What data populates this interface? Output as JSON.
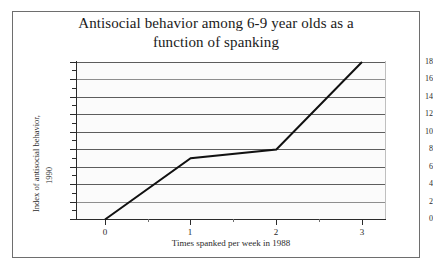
{
  "chart_data": {
    "type": "line",
    "title": "Antisocial behavior among 6-9 year olds as a function of spanking",
    "title_line1": "Antisocial behavior among 6-9 year olds as a",
    "title_line2": "function of spanking",
    "xlabel": "Times spanked per week in 1988",
    "ylabel": "Index of antisocial behavior, 1990",
    "ylabel_line1": "Index of antisocial behavior,",
    "ylabel_line2": "1990",
    "x": [
      0,
      1,
      2,
      3
    ],
    "values": [
      0,
      7,
      8,
      18
    ],
    "series": [
      {
        "name": "Index of antisocial behavior",
        "x": [
          0,
          1,
          2,
          3
        ],
        "values": [
          0,
          7,
          8,
          18
        ]
      }
    ],
    "xlim": [
      -0.33,
      3.25
    ],
    "ylim": [
      0,
      18
    ],
    "xticks": [
      0,
      1,
      2,
      3
    ],
    "xtick_labels": [
      "0",
      "1",
      "2",
      "3"
    ],
    "x_minor_ticks": [
      0.5,
      1.5,
      2.5
    ],
    "yticks": [
      0,
      2,
      4,
      6,
      8,
      10,
      12,
      14,
      16,
      18
    ],
    "ytick_labels": [
      "0",
      "2",
      "4",
      "6",
      "8",
      "10",
      "12",
      "14",
      "16",
      "18"
    ],
    "y_minor_ticks": [
      1,
      3,
      5,
      7,
      9,
      11,
      13,
      15,
      17
    ],
    "grid": true,
    "grid_axis": "y",
    "legend": false,
    "legend_position": "none",
    "colors": {
      "line": "#111111",
      "gridline": "#5d5d5d",
      "axis": "#2b2b2b",
      "plot_background": "#fbfbfb",
      "figure_background": "#ffffff",
      "frame": "#6e6e6e",
      "text": "#1a1a1a"
    },
    "line_width": 2
  }
}
